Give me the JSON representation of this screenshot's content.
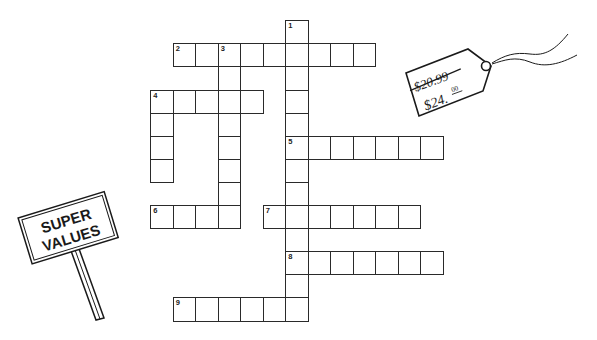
{
  "puzzle": {
    "type": "crossword",
    "grid_origin": {
      "x": 151,
      "y": 21
    },
    "cell_size": {
      "w": 22.5,
      "h": 23.1
    },
    "entries": [
      {
        "number": 1,
        "direction": "down",
        "row": 0,
        "col": 6,
        "length": 13
      },
      {
        "number": 2,
        "direction": "across",
        "row": 1,
        "col": 1,
        "length": 9
      },
      {
        "number": 3,
        "direction": "down",
        "row": 1,
        "col": 3,
        "length": 8
      },
      {
        "number": 4,
        "direction": "across",
        "row": 3,
        "col": 0,
        "length": 5
      },
      {
        "number": 4,
        "direction": "down",
        "row": 3,
        "col": 0,
        "length": 4
      },
      {
        "number": 5,
        "direction": "across",
        "row": 5,
        "col": 6,
        "length": 7
      },
      {
        "number": 6,
        "direction": "across",
        "row": 8,
        "col": 0,
        "length": 4
      },
      {
        "number": 7,
        "direction": "across",
        "row": 8,
        "col": 5,
        "length": 7
      },
      {
        "number": 8,
        "direction": "across",
        "row": 10,
        "col": 6,
        "length": 7
      },
      {
        "number": 9,
        "direction": "across",
        "row": 12,
        "col": 1,
        "length": 6
      }
    ]
  },
  "price_tag": {
    "old_price": "$20.99",
    "new_price": "$24.00",
    "new_price_main": "$24.",
    "new_price_cents": "00"
  },
  "sign": {
    "line1": "SUPER",
    "line2": "VALUES"
  },
  "colors": {
    "ink": "#2a2a2a",
    "background": "#ffffff"
  }
}
